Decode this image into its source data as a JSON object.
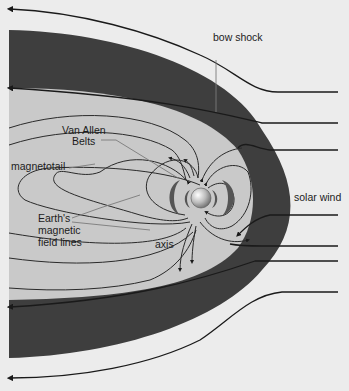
{
  "diagram": {
    "labels": {
      "bow_shock": "bow shock",
      "van_allen_1": "Van Allen",
      "van_allen_2": "Belts",
      "magnetotail": "magnetotail",
      "field_lines_1": "Earth's",
      "field_lines_2": "magnetic",
      "field_lines_3": "field lines",
      "axis": "axis",
      "solar_wind": "solar wind"
    },
    "colors": {
      "background": "#ececec",
      "bow_shock_region": "#3e3e3e",
      "magnetosphere": "#c9c9c9",
      "lines": "#1a1a1a",
      "leader_lines": "#7a7a7a"
    }
  }
}
